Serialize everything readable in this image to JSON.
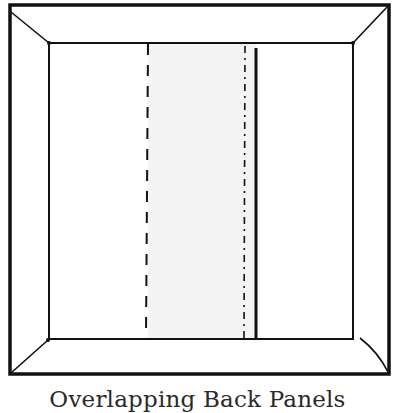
{
  "diagram": {
    "caption": "Overlapping Back Panels",
    "colors": {
      "stroke": "#111111",
      "panel_overlap_fill": "#f4f4f4",
      "background": "#ffffff"
    },
    "frame": {
      "outer": {
        "x1": 10,
        "y1": 5,
        "x2": 389,
        "y2": 374
      },
      "inner": {
        "x1": 49,
        "y1": 43,
        "x2": 353,
        "y2": 339
      }
    },
    "panels": {
      "left_panel_edge_dashed_x": 148,
      "right_panel_edge_dashdot_x": 245,
      "right_panel_edge_solid_x": 256,
      "overlap_region": {
        "x1": 148,
        "x2": 256
      }
    }
  }
}
